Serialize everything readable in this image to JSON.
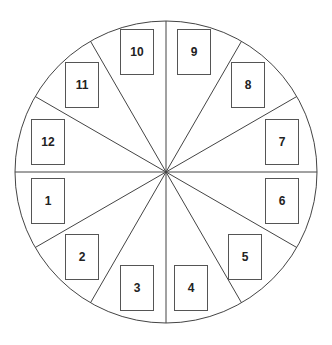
{
  "diagram": {
    "type": "circle-divided-into-12-sectors",
    "center": [
      166,
      172
    ],
    "radius": 151,
    "sector_count": 12,
    "line_color": "#444444",
    "slots": [
      {
        "label": "1",
        "x": 31,
        "y": 178
      },
      {
        "label": "2",
        "x": 65,
        "y": 234
      },
      {
        "label": "3",
        "x": 120,
        "y": 265
      },
      {
        "label": "4",
        "x": 174,
        "y": 265
      },
      {
        "label": "5",
        "x": 228,
        "y": 234
      },
      {
        "label": "6",
        "x": 265,
        "y": 178
      },
      {
        "label": "7",
        "x": 265,
        "y": 119
      },
      {
        "label": "8",
        "x": 231,
        "y": 62
      },
      {
        "label": "9",
        "x": 177,
        "y": 29
      },
      {
        "label": "10",
        "x": 120,
        "y": 29
      },
      {
        "label": "11",
        "x": 65,
        "y": 62
      },
      {
        "label": "12",
        "x": 31,
        "y": 119
      }
    ]
  }
}
